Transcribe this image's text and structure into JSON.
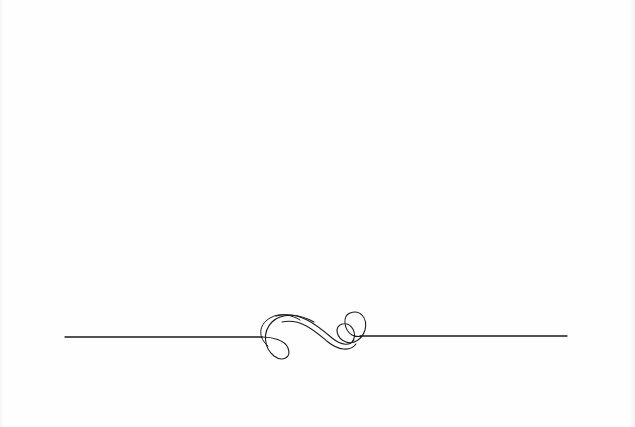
{
  "page": {
    "background": "#fefefe",
    "ink_color": "#1a1a1a"
  },
  "divider": {
    "label": "ornamental flourish divider",
    "line_left": {
      "x1": 65,
      "x2": 258,
      "y": 337
    },
    "line_right": {
      "x1": 362,
      "x2": 567,
      "y": 337
    }
  }
}
